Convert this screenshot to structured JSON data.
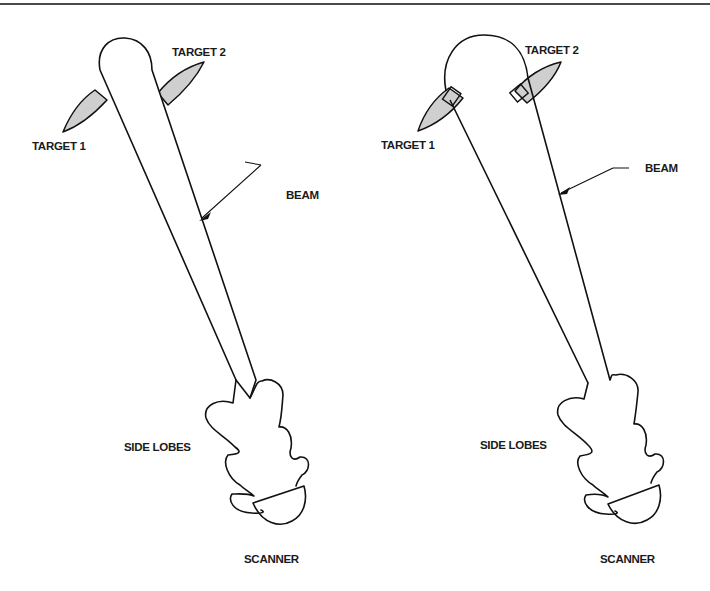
{
  "figure": {
    "panels": [
      {
        "id": "left",
        "description": "Beam narrow; targets outside beam",
        "labels": {
          "target1": "TARGET 1",
          "target2": "TARGET 2",
          "beam": "BEAM",
          "side_lobes": "SIDE LOBES",
          "scanner": "SCANNER"
        }
      },
      {
        "id": "right",
        "description": "Beam wide; both targets inside beam",
        "labels": {
          "target1": "TARGET 1",
          "target2": "TARGET 2",
          "beam": "BEAM",
          "side_lobes": "SIDE LOBES",
          "scanner": "SCANNER"
        }
      }
    ],
    "colors": {
      "line": "#111111",
      "target_fill": "#cfcfcf",
      "background": "#ffffff"
    }
  }
}
